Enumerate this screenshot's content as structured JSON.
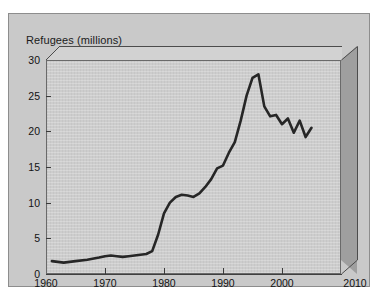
{
  "chart_data": {
    "type": "line",
    "title": "Refugees (millions)",
    "xlabel": "",
    "ylabel": "Refugees (millions)",
    "xlim": [
      1960,
      2010
    ],
    "ylim": [
      0,
      30
    ],
    "xticks": [
      1960,
      1970,
      1980,
      1990,
      2000,
      2010
    ],
    "xtick_labels": [
      "1960",
      "1970",
      "1980",
      "1990",
      "2000",
      "2010"
    ],
    "yticks": [
      0,
      5,
      10,
      15,
      20,
      25,
      30
    ],
    "ytick_labels": [
      "0",
      "5",
      "10",
      "15",
      "20",
      "25",
      "30"
    ],
    "grid": false,
    "legend": null,
    "line_color": "#262626",
    "plot_background": "#cdcdcd",
    "frame_background": "#c9c9c9",
    "box_side_color": "#9f9f9f",
    "box_top_color": "#d2d2d2",
    "series": [
      {
        "name": "Refugees",
        "x": [
          1961,
          1963,
          1965,
          1967,
          1969,
          1970,
          1971,
          1972,
          1973,
          1974,
          1975,
          1976,
          1977,
          1978,
          1979,
          1980,
          1981,
          1982,
          1983,
          1984,
          1985,
          1986,
          1987,
          1988,
          1989,
          1990,
          1991,
          1992,
          1993,
          1994,
          1995,
          1996,
          1997,
          1998,
          1999,
          2000,
          2001,
          2002,
          2003,
          2004,
          2005
        ],
        "values": [
          1.8,
          1.6,
          1.8,
          2.0,
          2.3,
          2.5,
          2.6,
          2.5,
          2.4,
          2.5,
          2.6,
          2.7,
          2.8,
          3.2,
          5.5,
          8.5,
          10.0,
          10.8,
          11.1,
          11.0,
          10.8,
          11.3,
          12.2,
          13.3,
          14.8,
          15.2,
          17.0,
          18.5,
          21.5,
          25.0,
          27.5,
          28.0,
          23.5,
          22.1,
          22.3,
          21.0,
          21.8,
          19.8,
          21.5,
          19.2,
          20.5
        ]
      }
    ],
    "annotations": {
      "peak_year": 1996,
      "peak_value": 28.0,
      "start_year": 1961,
      "start_value": 1.8,
      "end_year": 2005,
      "end_value": 20.5
    }
  }
}
